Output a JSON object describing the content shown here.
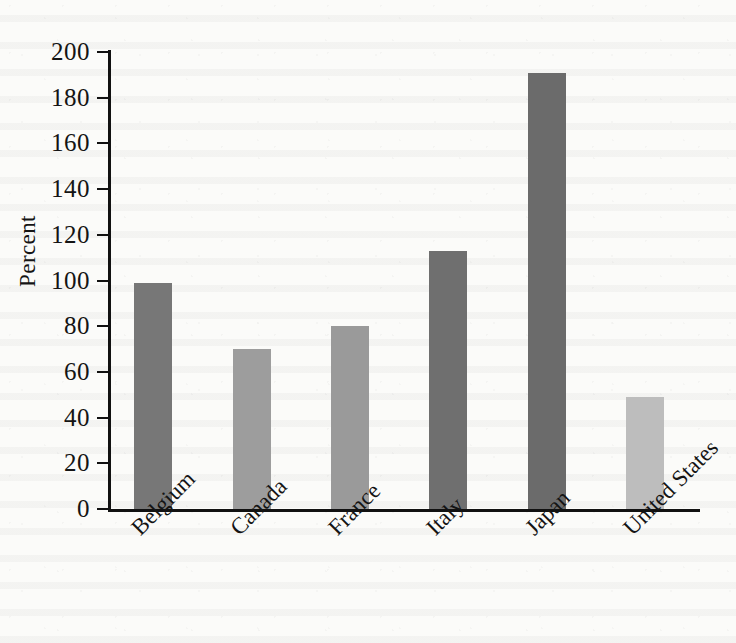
{
  "chart_data": {
    "type": "bar",
    "title": "",
    "subtitle": "",
    "xlabel": "",
    "ylabel": "Percent",
    "categories": [
      "Belgium",
      "Canada",
      "France",
      "Italy",
      "Japan",
      "United States"
    ],
    "values": [
      99,
      70,
      80,
      113,
      191,
      49
    ],
    "bar_colors": [
      "#777777",
      "#9d9d9d",
      "#9a9a9a",
      "#6f6f6f",
      "#6b6b6b",
      "#bdbdbd"
    ],
    "ylim": [
      0,
      200
    ],
    "ytick_step": 20,
    "yticks": [
      0,
      20,
      40,
      60,
      80,
      100,
      120,
      140,
      160,
      180,
      200
    ],
    "ytick_labels": [
      "0",
      "20",
      "40",
      "60",
      "80",
      "100",
      "120",
      "140",
      "160",
      "180",
      "200"
    ],
    "grid": false,
    "legend": "none",
    "xtick_rotation_deg": -45,
    "axis_color": "#111111",
    "background_color": "#fbfbf9",
    "series": [
      {
        "name": "Percent",
        "points": [
          {
            "category": "Belgium",
            "value": 99,
            "color": "#777777"
          },
          {
            "category": "Canada",
            "value": 70,
            "color": "#9d9d9d"
          },
          {
            "category": "France",
            "value": 80,
            "color": "#9a9a9a"
          },
          {
            "category": "Italy",
            "value": 113,
            "color": "#6f6f6f"
          },
          {
            "category": "Japan",
            "value": 191,
            "color": "#6b6b6b"
          },
          {
            "category": "United States",
            "value": 49,
            "color": "#bdbdbd"
          }
        ]
      }
    ]
  }
}
